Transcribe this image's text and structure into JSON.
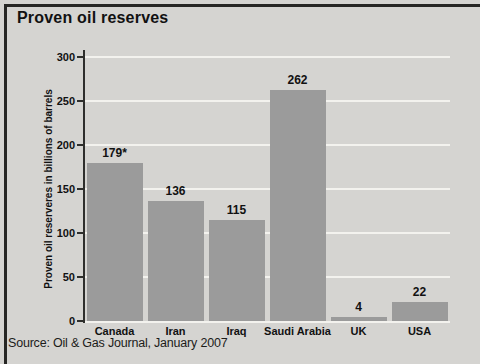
{
  "title": "Proven oil reserves",
  "source": "Source: Oil & Gas Journal, January 2007",
  "colors": {
    "background": "#d5d4d1",
    "bar": "#9b9b9b",
    "gridline": "#f3f2ee",
    "axis": "#2e2e2c",
    "text": "#111111",
    "frame": "#262624"
  },
  "chart_data": {
    "type": "bar",
    "title": "Proven oil reserves",
    "categories": [
      "Canada",
      "Iran",
      "Iraq",
      "Saudi Arabia",
      "UK",
      "USA"
    ],
    "values": [
      179,
      136,
      115,
      262,
      4,
      22
    ],
    "value_labels": [
      "179*",
      "136",
      "115",
      "262",
      "4",
      "22"
    ],
    "xlabel": "",
    "ylabel": "Proven oil reserveres in billions of barrels",
    "ylim": [
      0,
      300
    ],
    "yticks": [
      0,
      50,
      100,
      150,
      200,
      250,
      300
    ],
    "grid": true,
    "legend": false,
    "source_note": "Source: Oil & Gas Journal, January 2007"
  }
}
